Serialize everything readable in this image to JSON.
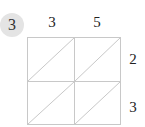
{
  "question": {
    "number": "3"
  },
  "lattice": {
    "top_digits": [
      "3",
      "5"
    ],
    "right_digits": [
      "2",
      "3"
    ],
    "rows": 2,
    "cols": 2,
    "line_color": "#c8c8c8",
    "badge_color": "#e4e4e4"
  }
}
